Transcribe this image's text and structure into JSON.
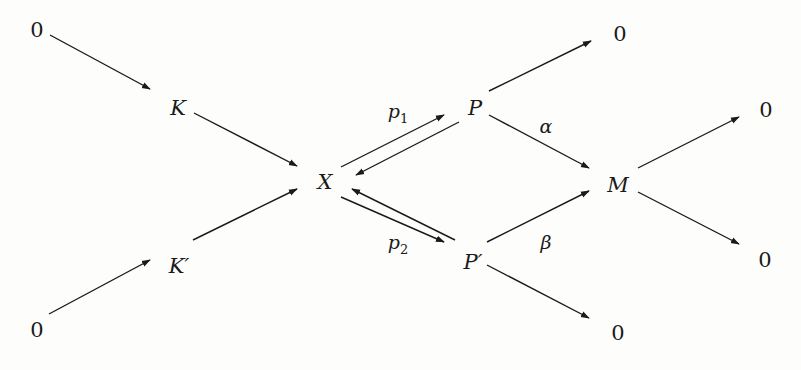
{
  "diagram": {
    "type": "reaction network",
    "nodes": {
      "source_top": "0",
      "K": "K",
      "X": "X",
      "K_prime": "K′",
      "source_bottom": "0",
      "P": "P",
      "P_prime": "P′",
      "M": "M",
      "sink_P": "0",
      "sink_P_prime": "0",
      "sink_M_top": "0",
      "sink_M_bottom": "0"
    },
    "edge_labels": {
      "p1": {
        "base": "p",
        "sub": "1"
      },
      "p2": {
        "base": "p",
        "sub": "2"
      },
      "alpha": "α",
      "beta": "β"
    },
    "edges": [
      {
        "from": "source_top",
        "to": "K"
      },
      {
        "from": "K",
        "to": "X"
      },
      {
        "from": "source_bottom",
        "to": "K_prime"
      },
      {
        "from": "K_prime",
        "to": "X"
      },
      {
        "from": "X",
        "to": "P",
        "label": "p1"
      },
      {
        "from": "P",
        "to": "X"
      },
      {
        "from": "X",
        "to": "P_prime",
        "label": "p2"
      },
      {
        "from": "P_prime",
        "to": "X"
      },
      {
        "from": "P",
        "to": "sink_P"
      },
      {
        "from": "P",
        "to": "M",
        "label": "alpha"
      },
      {
        "from": "P_prime",
        "to": "M",
        "label": "beta"
      },
      {
        "from": "P_prime",
        "to": "sink_P_prime"
      },
      {
        "from": "M",
        "to": "sink_M_top"
      },
      {
        "from": "M",
        "to": "sink_M_bottom"
      }
    ],
    "colors": {
      "ink": "#1a1a1a",
      "background": "#fdfdfb"
    }
  }
}
